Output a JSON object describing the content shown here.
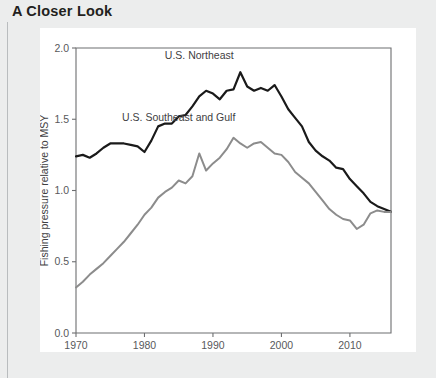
{
  "page": {
    "title": "A Closer Look",
    "background_color": "#eceded",
    "card_color": "#ffffff",
    "rule_color": "#b9bcbe"
  },
  "chart_data": {
    "type": "line",
    "title": "",
    "xlabel": "Year",
    "ylabel": "Fishing pressure relative to MSY",
    "xlim": [
      1970,
      2016
    ],
    "ylim": [
      0.0,
      2.0
    ],
    "xticks": [
      1970,
      1980,
      1990,
      2000,
      2010
    ],
    "yticks": [
      0.0,
      0.5,
      1.0,
      1.5,
      2.0
    ],
    "ytick_labels": [
      "0.0",
      "0.5",
      "1.0",
      "1.5",
      "2.0"
    ],
    "xtick_labels": [
      "1970",
      "1980",
      "1990",
      "2000",
      "2010"
    ],
    "grid": false,
    "legend": "inline-annotations",
    "x": [
      1970,
      1971,
      1972,
      1973,
      1974,
      1975,
      1976,
      1977,
      1978,
      1979,
      1980,
      1981,
      1982,
      1983,
      1984,
      1985,
      1986,
      1987,
      1988,
      1989,
      1990,
      1991,
      1992,
      1993,
      1994,
      1995,
      1996,
      1997,
      1998,
      1999,
      2000,
      2001,
      2002,
      2003,
      2004,
      2005,
      2006,
      2007,
      2008,
      2009,
      2010,
      2011,
      2012,
      2013,
      2014,
      2015,
      2016
    ],
    "series": [
      {
        "name": "U.S. Northeast",
        "color": "#1a1a1a",
        "width": 2.2,
        "label_x": 1988,
        "label_y": 1.92,
        "values": [
          1.24,
          1.25,
          1.23,
          1.26,
          1.3,
          1.33,
          1.33,
          1.33,
          1.32,
          1.31,
          1.27,
          1.35,
          1.45,
          1.47,
          1.47,
          1.52,
          1.53,
          1.59,
          1.66,
          1.7,
          1.68,
          1.64,
          1.7,
          1.71,
          1.83,
          1.73,
          1.7,
          1.72,
          1.7,
          1.74,
          1.66,
          1.57,
          1.51,
          1.45,
          1.34,
          1.28,
          1.24,
          1.21,
          1.16,
          1.15,
          1.08,
          1.03,
          0.98,
          0.92,
          0.89,
          0.87,
          0.85
        ]
      },
      {
        "name": "U.S. Southeast and Gulf",
        "color": "#8c8c8c",
        "width": 2.0,
        "label_x": 1985,
        "label_y": 1.49,
        "values": [
          0.32,
          0.36,
          0.41,
          0.45,
          0.49,
          0.54,
          0.59,
          0.64,
          0.7,
          0.76,
          0.83,
          0.88,
          0.95,
          0.99,
          1.02,
          1.07,
          1.05,
          1.1,
          1.26,
          1.14,
          1.19,
          1.23,
          1.29,
          1.37,
          1.33,
          1.3,
          1.33,
          1.34,
          1.3,
          1.26,
          1.25,
          1.2,
          1.13,
          1.09,
          1.05,
          0.99,
          0.93,
          0.87,
          0.83,
          0.8,
          0.79,
          0.73,
          0.76,
          0.84,
          0.86,
          0.85,
          0.85
        ]
      }
    ]
  }
}
